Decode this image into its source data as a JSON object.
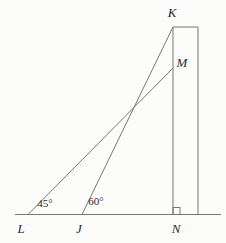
{
  "diagram": {
    "width": 226,
    "height": 243,
    "background_color": "#fcfcfb",
    "line_color": "#777777",
    "line_width": 1,
    "label_color": "#2a2a2a",
    "points": [
      {
        "id": "K",
        "label": "K",
        "x": 173,
        "y": 27,
        "label_x": 172,
        "label_y": 17
      },
      {
        "id": "M",
        "label": "M",
        "x": 173,
        "y": 68,
        "label_x": 182,
        "label_y": 67
      },
      {
        "id": "L",
        "label": "L",
        "x": 28,
        "y": 214,
        "label_x": 21,
        "label_y": 233
      },
      {
        "id": "J",
        "label": "J",
        "x": 82,
        "y": 214,
        "label_x": 79,
        "label_y": 233
      },
      {
        "id": "N",
        "label": "N",
        "x": 173,
        "y": 214,
        "label_x": 176,
        "label_y": 233
      }
    ],
    "segments": [
      {
        "name": "ground-line",
        "x1": 15,
        "y1": 214.5,
        "x2": 221,
        "y2": 214.5
      },
      {
        "name": "tower-left-edge",
        "x1": 173,
        "y1": 27,
        "x2": 173,
        "y2": 214.5
      },
      {
        "name": "tower-right-edge",
        "x1": 198,
        "y1": 27,
        "x2": 198,
        "y2": 214.5
      },
      {
        "name": "tower-top-edge",
        "x1": 173,
        "y1": 27,
        "x2": 198,
        "y2": 27
      },
      {
        "name": "sightline-L-to-M",
        "x1": 28,
        "y1": 214.5,
        "x2": 173,
        "y2": 68
      },
      {
        "name": "sightline-J-to-K",
        "x1": 82,
        "y1": 214.5,
        "x2": 173,
        "y2": 27
      }
    ],
    "angle_labels": [
      {
        "name": "angle-at-L",
        "text": "45°",
        "x": 45,
        "y": 207
      },
      {
        "name": "angle-at-J",
        "text": "60°",
        "x": 96,
        "y": 205
      }
    ],
    "right_angle_marker": {
      "x": 173,
      "y": 207.5,
      "size": 7
    }
  }
}
